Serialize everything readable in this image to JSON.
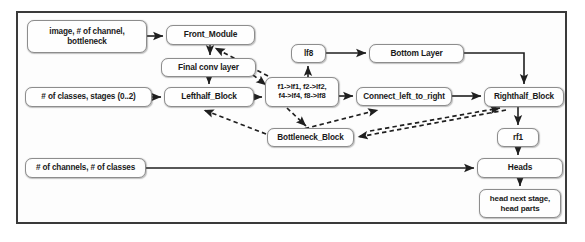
{
  "diagram": {
    "frame": {
      "border_color": "#3a3a3a"
    },
    "style": {
      "node_border": "#8d8d8d",
      "node_fill": "#fefefe",
      "edge_color": "#1f1f1f",
      "text_color": "#1a1a1a"
    },
    "nodes": [
      {
        "id": "image_input",
        "label_line1": "image, # of channel,",
        "label_line2": "bottleneck",
        "kind": "input"
      },
      {
        "id": "front_module",
        "label_line1": "Front_Module",
        "label_line2": "",
        "kind": "module"
      },
      {
        "id": "final_conv",
        "label_line1": "Final conv layer",
        "label_line2": "",
        "kind": "module"
      },
      {
        "id": "classes_input",
        "label_line1": "# of classes, stages (0..2)",
        "label_line2": "",
        "kind": "input"
      },
      {
        "id": "lefthalf_block",
        "label_line1": "Lefthalf_Block",
        "label_line2": "",
        "kind": "module"
      },
      {
        "id": "feature_map",
        "label_line1": "f1->lf1, f2->lf2,",
        "label_line2": "f4->lf4, f8->lf8",
        "kind": "mapping"
      },
      {
        "id": "lf8",
        "label_line1": "lf8",
        "label_line2": "",
        "kind": "tensor"
      },
      {
        "id": "bottom_layer",
        "label_line1": "Bottom Layer",
        "label_line2": "",
        "kind": "module"
      },
      {
        "id": "connect_l2r",
        "label_line1": "Connect_left_to_right",
        "label_line2": "",
        "kind": "module"
      },
      {
        "id": "righthalf_block",
        "label_line1": "Righthalf_Block",
        "label_line2": "",
        "kind": "module"
      },
      {
        "id": "bottleneck_block",
        "label_line1": "Bottleneck_Block",
        "label_line2": "",
        "kind": "module"
      },
      {
        "id": "rf1",
        "label_line1": "rf1",
        "label_line2": "",
        "kind": "tensor"
      },
      {
        "id": "channels_input",
        "label_line1": "# of channels, # of classes",
        "label_line2": "",
        "kind": "input"
      },
      {
        "id": "heads",
        "label_line1": "Heads",
        "label_line2": "",
        "kind": "module"
      },
      {
        "id": "head_parts",
        "label_line1": "head next stage,",
        "label_line2": "head parts",
        "kind": "output"
      }
    ],
    "edges": [
      {
        "from": "image_input",
        "to": "front_module",
        "style": "solid"
      },
      {
        "from": "front_module",
        "to": "final_conv",
        "style": "solid"
      },
      {
        "from": "final_conv",
        "to": "lefthalf_block",
        "style": "solid"
      },
      {
        "from": "classes_input",
        "to": "lefthalf_block",
        "style": "solid"
      },
      {
        "from": "lefthalf_block",
        "to": "feature_map",
        "style": "solid"
      },
      {
        "from": "feature_map",
        "to": "lf8",
        "style": "solid"
      },
      {
        "from": "lf8",
        "to": "bottom_layer",
        "style": "solid"
      },
      {
        "from": "bottom_layer",
        "to": "righthalf_block",
        "style": "solid"
      },
      {
        "from": "feature_map",
        "to": "connect_l2r",
        "style": "solid"
      },
      {
        "from": "connect_l2r",
        "to": "righthalf_block",
        "style": "solid"
      },
      {
        "from": "righthalf_block",
        "to": "rf1",
        "style": "solid"
      },
      {
        "from": "rf1",
        "to": "heads",
        "style": "solid"
      },
      {
        "from": "channels_input",
        "to": "heads",
        "style": "solid"
      },
      {
        "from": "heads",
        "to": "head_parts",
        "style": "solid"
      },
      {
        "from": "feature_map",
        "to": "front_module",
        "style": "dashed"
      },
      {
        "from": "final_conv",
        "to": "feature_map",
        "style": "dashed"
      },
      {
        "from": "feature_map",
        "to": "bottleneck_block",
        "style": "dashed"
      },
      {
        "from": "bottleneck_block",
        "to": "lefthalf_block",
        "style": "dashed"
      },
      {
        "from": "bottleneck_block",
        "to": "connect_l2r",
        "style": "dashed"
      },
      {
        "from": "righthalf_block",
        "to": "bottleneck_block",
        "style": "dashed"
      }
    ]
  }
}
